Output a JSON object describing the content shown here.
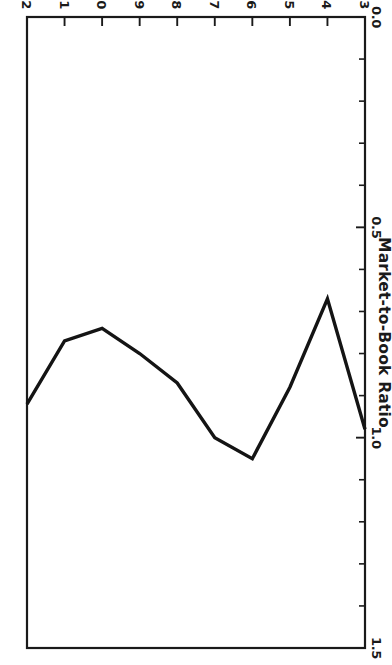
{
  "chart_data": {
    "type": "line",
    "title": "",
    "xlabel": "",
    "ylabel": "Market-to-Book Ratio",
    "x": [
      1973,
      1974,
      1975,
      1976,
      1977,
      1978,
      1979,
      1980,
      1981,
      1982
    ],
    "values": [
      0.98,
      0.67,
      0.88,
      1.05,
      1.0,
      0.87,
      0.8,
      0.74,
      0.77,
      0.92
    ],
    "series": [
      {
        "name": "Market-to-Book Ratio",
        "values": [
          0.98,
          0.67,
          0.88,
          1.05,
          1.0,
          0.87,
          0.8,
          0.74,
          0.77,
          0.92
        ]
      }
    ],
    "xlim": [
      1973,
      1982
    ],
    "ylim": [
      0.0,
      1.5
    ],
    "xticklabels": [
      "1973",
      "1974",
      "1975",
      "1976",
      "1977",
      "1978",
      "1979",
      "1980",
      "1981",
      "1982"
    ],
    "yticklabels": [
      "0.0",
      "0.5",
      "1.0",
      "1.5"
    ],
    "ytickvalues": [
      0.0,
      0.5,
      1.0,
      1.5
    ],
    "y_minor_tick_step": 0.1,
    "grid": false,
    "legend": "none",
    "line_color": "#141414",
    "axis_color": "#1a1a1a",
    "background_color": "#ffffff",
    "orientation": "rotated-180"
  },
  "axes": {
    "y_title": "Market-to-Book Ratio",
    "y_ticks": [
      {
        "value": 0.0,
        "label": "0.0"
      },
      {
        "value": 0.5,
        "label": "0.5"
      },
      {
        "value": 1.0,
        "label": "1.0"
      },
      {
        "value": 1.5,
        "label": "1.5"
      }
    ],
    "x_ticks": [
      {
        "value": 1973,
        "label": "1973"
      },
      {
        "value": 1974,
        "label": "1974"
      },
      {
        "value": 1975,
        "label": "1975"
      },
      {
        "value": 1976,
        "label": "1976"
      },
      {
        "value": 1977,
        "label": "1977"
      },
      {
        "value": 1978,
        "label": "1978"
      },
      {
        "value": 1979,
        "label": "1979"
      },
      {
        "value": 1980,
        "label": "1980"
      },
      {
        "value": 1981,
        "label": "1981"
      },
      {
        "value": 1982,
        "label": "1982"
      }
    ]
  }
}
